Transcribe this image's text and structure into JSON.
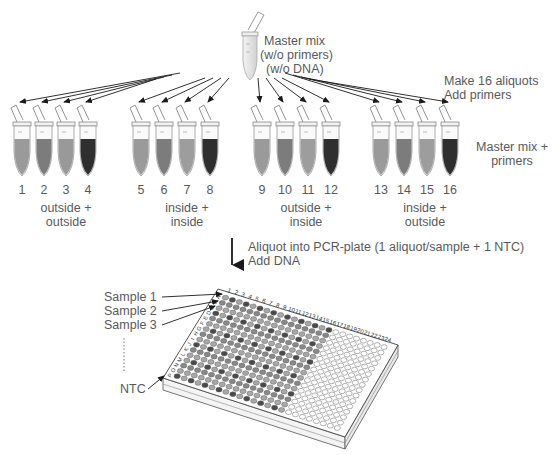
{
  "master": {
    "line1": "Master mix",
    "line2": "(w/o primers)",
    "line3": "(w/o DNA)"
  },
  "aliquot_step": {
    "line1": "Make 16 aliquots",
    "line2": "Add primers"
  },
  "tubes_label": {
    "line1": "Master mix +",
    "line2": "primers"
  },
  "tubes": [
    {
      "n": "1",
      "x": 22,
      "fill": "#9a9a9a"
    },
    {
      "n": "2",
      "x": 44,
      "fill": "#7c7c7c"
    },
    {
      "n": "3",
      "x": 66,
      "fill": "#999999"
    },
    {
      "n": "4",
      "x": 88,
      "fill": "#2f2f2f"
    },
    {
      "n": "5",
      "x": 141,
      "fill": "#9a9a9a"
    },
    {
      "n": "6",
      "x": 164,
      "fill": "#7c7c7c"
    },
    {
      "n": "7",
      "x": 187,
      "fill": "#9d9d9d"
    },
    {
      "n": "8",
      "x": 210,
      "fill": "#2f2f2f"
    },
    {
      "n": "9",
      "x": 262,
      "fill": "#9a9a9a"
    },
    {
      "n": "10",
      "x": 285,
      "fill": "#7c7c7c"
    },
    {
      "n": "11",
      "x": 308,
      "fill": "#9d9d9d"
    },
    {
      "n": "12",
      "x": 331,
      "fill": "#2f2f2f"
    },
    {
      "n": "13",
      "x": 381,
      "fill": "#9a9a9a"
    },
    {
      "n": "14",
      "x": 404,
      "fill": "#7c7c7c"
    },
    {
      "n": "15",
      "x": 427,
      "fill": "#9d9d9d"
    },
    {
      "n": "16",
      "x": 450,
      "fill": "#2f2f2f"
    }
  ],
  "groups": [
    {
      "line1": "outside +",
      "line2": "outside",
      "cx": 66
    },
    {
      "line1": "inside +",
      "line2": "inside",
      "cx": 187
    },
    {
      "line1": "outside +",
      "line2": "inside",
      "cx": 306
    },
    {
      "line1": "inside +",
      "line2": "outside",
      "cx": 425
    }
  ],
  "plate_step": {
    "line1": "Aliquot into PCR-plate (1 aliquot/sample + 1 NTC)",
    "line2": "Add DNA"
  },
  "plate_labels": {
    "sample1": "Sample 1",
    "sample2": "Sample 2",
    "sample3": "Sample 3",
    "ntc": "NTC"
  },
  "plate": {
    "rows": [
      "A",
      "B",
      "C",
      "D",
      "E",
      "F",
      "G",
      "H",
      "I",
      "J",
      "K",
      "L",
      "M",
      "N",
      "O",
      "P"
    ],
    "columns": [
      "1",
      "2",
      "3",
      "4",
      "5",
      "6",
      "7",
      "8",
      "9",
      "10",
      "11",
      "12",
      "13",
      "14",
      "15",
      "16",
      "17",
      "18",
      "19",
      "20",
      "21",
      "22",
      "23",
      "24"
    ],
    "filled_columns": 16,
    "colors": {
      "light": "#a8a8a8",
      "mid": "#888888",
      "dark": "#4a4a4a",
      "empty": "#ffffff",
      "outline": "#666666"
    }
  }
}
